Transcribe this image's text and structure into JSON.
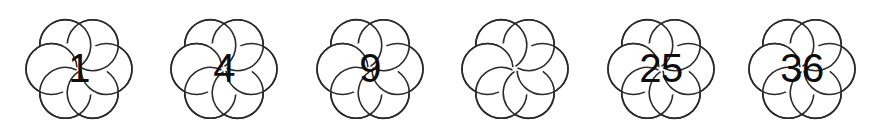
{
  "page": {
    "background_color": "#ffffff",
    "outline_color": "#2b2b2b",
    "digit_color": "#0d0d0d"
  },
  "sequence": {
    "shape": "six-petal-flower",
    "count": 6,
    "items": [
      {
        "index": 1,
        "value": "1",
        "blank": false,
        "center_x": 79
      },
      {
        "index": 2,
        "value": "4",
        "blank": false,
        "center_x": 224
      },
      {
        "index": 3,
        "value": "9",
        "blank": false,
        "center_x": 370
      },
      {
        "index": 4,
        "value": "",
        "blank": true,
        "center_x": 515
      },
      {
        "index": 5,
        "value": "25",
        "blank": false,
        "center_x": 661
      },
      {
        "index": 6,
        "value": "36",
        "blank": false,
        "center_x": 802
      }
    ]
  }
}
